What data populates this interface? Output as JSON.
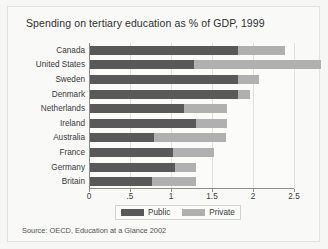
{
  "chart_data": {
    "type": "bar",
    "orientation": "horizontal",
    "stacked": true,
    "title": "Spending on tertiary education as % of GDP, 1999",
    "xlabel": "",
    "ylabel": "",
    "xlim": [
      0,
      2.5
    ],
    "xticks": [
      0,
      0.5,
      1,
      1.5,
      2,
      2.5
    ],
    "xtick_labels": [
      "0",
      ".5",
      "1",
      "1.5",
      "2",
      "2.5"
    ],
    "grid": true,
    "grid_axis": "x",
    "legend_position": "bottom",
    "categories": [
      "Canada",
      "United States",
      "Sweden",
      "Denmark",
      "Netherlands",
      "Ireland",
      "Australia",
      "France",
      "Germany",
      "Britain"
    ],
    "series": [
      {
        "name": "Public",
        "color": "#595959",
        "values": [
          1.82,
          1.28,
          1.82,
          1.82,
          1.16,
          1.31,
          0.79,
          1.02,
          1.05,
          0.77
        ]
      },
      {
        "name": "Private",
        "color": "#b0b0b0",
        "values": [
          0.57,
          1.55,
          0.25,
          0.14,
          0.52,
          0.37,
          0.88,
          0.51,
          0.26,
          0.54
        ]
      }
    ],
    "totals": [
      2.39,
      2.83,
      2.07,
      1.96,
      1.68,
      1.68,
      1.67,
      1.53,
      1.31,
      1.31
    ],
    "source": "Source:  OECD, Education at a Glance 2002"
  },
  "legend": {
    "items": [
      {
        "label": "Public"
      },
      {
        "label": "Private"
      }
    ]
  },
  "colors": {
    "public": "#595959",
    "private": "#b0b0b0",
    "axis": "#8d8d8b",
    "grid": "#e0e0de",
    "background": "#f9f9f8"
  }
}
